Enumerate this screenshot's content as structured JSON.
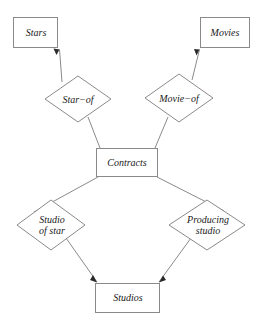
{
  "diagram": {
    "type": "entity-relationship-diagram",
    "title": "",
    "colors": {
      "background": "#ffffff",
      "stroke": "#8a8a8a",
      "text": "#1a1a1a",
      "arrow": "#2a2a2a"
    },
    "entities": [
      {
        "id": "stars",
        "label": "Stars",
        "shape": "rectangle",
        "x": 13,
        "y": 17,
        "width": 45,
        "height": 31
      },
      {
        "id": "movies",
        "label": "Movies",
        "shape": "rectangle",
        "x": 200,
        "y": 17,
        "width": 50,
        "height": 31
      },
      {
        "id": "contracts",
        "label": "Contracts",
        "shape": "rectangle",
        "x": 96,
        "y": 148,
        "width": 62,
        "height": 29
      },
      {
        "id": "studios",
        "label": "Studios",
        "shape": "rectangle",
        "x": 95,
        "y": 283,
        "width": 65,
        "height": 30
      }
    ],
    "relationships": [
      {
        "id": "star-of",
        "label": "Star−of",
        "shape": "diamond",
        "cx": 78,
        "cy": 99,
        "half_width": 33,
        "half_height": 23
      },
      {
        "id": "movie-of",
        "label": "Movie−of",
        "shape": "diamond",
        "cx": 179,
        "cy": 98,
        "half_width": 34,
        "half_height": 24
      },
      {
        "id": "studio-of-star",
        "label": "Studio\nof star",
        "label_lines": [
          "Studio",
          "of star"
        ],
        "shape": "diamond",
        "cx": 51,
        "cy": 225,
        "half_width": 34,
        "half_height": 25
      },
      {
        "id": "producing-studio",
        "label": "Producing\nstudio",
        "label_lines": [
          "Producing",
          "studio"
        ],
        "shape": "diamond",
        "cx": 207,
        "cy": 225,
        "half_width": 38,
        "half_height": 25
      }
    ],
    "edges": [
      {
        "id": "star-of-to-stars",
        "from": "star-of",
        "to": "stars",
        "arrow": "to",
        "x1": 62,
        "y1": 82,
        "x2": 58,
        "y2": 48
      },
      {
        "id": "star-of-to-contracts",
        "from": "star-of",
        "to": "contracts",
        "arrow": "none",
        "x1": 88,
        "y1": 117,
        "x2": 100,
        "y2": 148
      },
      {
        "id": "movie-of-to-movies",
        "from": "movie-of",
        "to": "movies",
        "arrow": "to",
        "x1": 192,
        "y1": 80,
        "x2": 200,
        "y2": 48
      },
      {
        "id": "movie-of-to-contracts",
        "from": "movie-of",
        "to": "contracts",
        "arrow": "none",
        "x1": 168,
        "y1": 117,
        "x2": 155,
        "y2": 148
      },
      {
        "id": "contracts-to-studio-of-star",
        "from": "contracts",
        "to": "studio-of-star",
        "arrow": "none",
        "x1": 98,
        "y1": 177,
        "x2": 36,
        "y2": 212
      },
      {
        "id": "studio-of-star-to-studios",
        "from": "studio-of-star",
        "to": "studios",
        "arrow": "to",
        "x1": 66,
        "y1": 238,
        "x2": 96,
        "y2": 283
      },
      {
        "id": "contracts-to-producing-studio",
        "from": "contracts",
        "to": "producing-studio",
        "arrow": "none",
        "x1": 157,
        "y1": 177,
        "x2": 222,
        "y2": 211
      },
      {
        "id": "producing-studio-to-studios",
        "from": "producing-studio",
        "to": "studios",
        "arrow": "to",
        "x1": 191,
        "y1": 238,
        "x2": 160,
        "y2": 283
      }
    ]
  }
}
